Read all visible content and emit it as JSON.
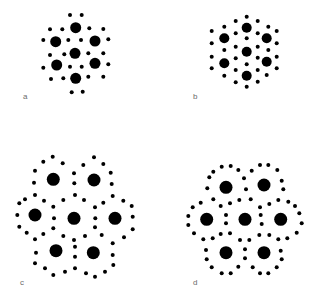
{
  "figure": {
    "dot_color": "#000000",
    "label_color": "#6a6a6a",
    "panels": [
      {
        "id": "a",
        "label": "a",
        "label_pos": [
          23,
          93
        ],
        "large_radius": 5.5,
        "small_radius": 2,
        "large": [
          [
            75.7,
            27.7
          ],
          [
            55.7,
            41.7
          ],
          [
            95,
            41
          ],
          [
            75,
            53.3
          ],
          [
            56.7,
            65
          ],
          [
            95,
            63.3
          ],
          [
            75.7,
            78.3
          ]
        ],
        "small": [
          [
            70,
            15
          ],
          [
            81.7,
            15
          ],
          [
            50,
            29.3
          ],
          [
            62.3,
            29.3
          ],
          [
            89.3,
            28.3
          ],
          [
            103.3,
            29
          ],
          [
            43.3,
            40
          ],
          [
            68.3,
            40
          ],
          [
            81,
            40
          ],
          [
            108.3,
            39.3
          ],
          [
            50,
            55
          ],
          [
            64.3,
            54.3
          ],
          [
            88.3,
            53.3
          ],
          [
            103.3,
            53.3
          ],
          [
            43.3,
            67.7
          ],
          [
            70,
            66.7
          ],
          [
            81.7,
            66.7
          ],
          [
            108.3,
            64.3
          ],
          [
            51,
            79
          ],
          [
            63.3,
            78.3
          ],
          [
            88.3,
            76.7
          ],
          [
            103.3,
            76.7
          ],
          [
            71.7,
            92.3
          ],
          [
            82.7,
            91.7
          ]
        ]
      },
      {
        "id": "b",
        "label": "b",
        "label_pos": [
          193,
          93
        ],
        "large_radius": 5,
        "small_radius": 2,
        "large": [
          [
            246.7,
            27.7
          ],
          [
            224.3,
            38.3
          ],
          [
            266.7,
            38.3
          ],
          [
            246.7,
            51.7
          ],
          [
            224.3,
            63.3
          ],
          [
            266.7,
            61.7
          ],
          [
            246.7,
            75.7
          ]
        ],
        "small": [
          [
            246.7,
            16.7
          ],
          [
            235.7,
            21
          ],
          [
            257.7,
            21
          ],
          [
            224.3,
            26.7
          ],
          [
            268.3,
            26.7
          ],
          [
            235.7,
            33.3
          ],
          [
            257.7,
            33.3
          ],
          [
            211.7,
            31
          ],
          [
            276.7,
            31
          ],
          [
            211.7,
            43.3
          ],
          [
            276.7,
            43.3
          ],
          [
            246.7,
            38.3
          ],
          [
            224.3,
            50
          ],
          [
            268.3,
            50
          ],
          [
            235.7,
            46.7
          ],
          [
            257.7,
            46.7
          ],
          [
            235.7,
            58.3
          ],
          [
            257.7,
            57.7
          ],
          [
            211.7,
            56.7
          ],
          [
            276.7,
            56.7
          ],
          [
            246.7,
            64.3
          ],
          [
            211.7,
            68.3
          ],
          [
            276.7,
            68.3
          ],
          [
            235.7,
            70
          ],
          [
            257.7,
            70
          ],
          [
            224.3,
            75.7
          ],
          [
            266.7,
            75
          ],
          [
            235.7,
            82.3
          ],
          [
            257.7,
            81.7
          ],
          [
            246.7,
            86.7
          ]
        ]
      },
      {
        "id": "c",
        "label": "c",
        "label_pos": [
          20,
          279
        ],
        "large_radius": 6.5,
        "small_radius": 2,
        "large": [
          [
            53.3,
            179.3
          ],
          [
            94,
            180
          ],
          [
            35,
            215
          ],
          [
            74,
            218.3
          ],
          [
            115,
            218.3
          ],
          [
            56,
            250.7
          ],
          [
            93.3,
            252.7
          ]
        ],
        "small": [
          [
            52.7,
            156.7
          ],
          [
            43.3,
            161.7
          ],
          [
            62.7,
            163.3
          ],
          [
            94,
            157.3
          ],
          [
            83.3,
            165
          ],
          [
            103.3,
            164
          ],
          [
            35,
            170.7
          ],
          [
            74,
            173.3
          ],
          [
            110.7,
            172.7
          ],
          [
            34,
            182.7
          ],
          [
            74.3,
            183.3
          ],
          [
            111.7,
            184
          ],
          [
            35,
            195
          ],
          [
            25,
            199.3
          ],
          [
            44,
            200.7
          ],
          [
            63.3,
            200
          ],
          [
            75,
            195
          ],
          [
            84,
            200
          ],
          [
            103.3,
            202.7
          ],
          [
            112.7,
            196
          ],
          [
            123.3,
            200.7
          ],
          [
            19.3,
            203.3
          ],
          [
            131.7,
            206
          ],
          [
            53.3,
            206.7
          ],
          [
            95,
            207.3
          ],
          [
            17.3,
            215
          ],
          [
            54,
            218.3
          ],
          [
            95.3,
            218.3
          ],
          [
            132.7,
            216.7
          ],
          [
            19.3,
            226.7
          ],
          [
            53.3,
            228.3
          ],
          [
            95,
            227.3
          ],
          [
            132.7,
            229.3
          ],
          [
            26.7,
            232.7
          ],
          [
            43.3,
            234
          ],
          [
            63.3,
            236
          ],
          [
            74,
            240
          ],
          [
            85,
            236
          ],
          [
            101.7,
            235
          ],
          [
            124,
            237.3
          ],
          [
            35,
            239.3
          ],
          [
            112.7,
            243.3
          ],
          [
            36,
            252.7
          ],
          [
            75,
            246.7
          ],
          [
            112.7,
            255
          ],
          [
            35,
            263.3
          ],
          [
            75,
            256.7
          ],
          [
            45,
            268.3
          ],
          [
            53.3,
            275
          ],
          [
            65,
            271.7
          ],
          [
            75,
            268.3
          ],
          [
            86,
            273.3
          ],
          [
            95,
            276.7
          ],
          [
            105,
            271.7
          ],
          [
            113.3,
            265
          ]
        ]
      },
      {
        "id": "d",
        "label": "d",
        "label_pos": [
          193,
          279
        ],
        "large_radius": 6.5,
        "small_radius": 2,
        "large": [
          [
            226,
            187.3
          ],
          [
            264,
            185
          ],
          [
            206.7,
            219.3
          ],
          [
            245,
            219.3
          ],
          [
            280.7,
            219.3
          ],
          [
            226,
            252.7
          ],
          [
            264,
            252.7
          ]
        ],
        "small": [
          [
            221.7,
            166.7
          ],
          [
            230.7,
            166
          ],
          [
            213.3,
            171.7
          ],
          [
            238.3,
            170
          ],
          [
            260,
            165
          ],
          [
            268.3,
            165
          ],
          [
            251.7,
            170.7
          ],
          [
            277.3,
            170
          ],
          [
            209.3,
            177.3
          ],
          [
            244,
            178.3
          ],
          [
            281.7,
            180.7
          ],
          [
            207.3,
            188.3
          ],
          [
            246,
            189.3
          ],
          [
            283.3,
            189.3
          ],
          [
            213.3,
            199.3
          ],
          [
            239.3,
            200
          ],
          [
            250.7,
            199.3
          ],
          [
            200.7,
            202.7
          ],
          [
            220.7,
            206
          ],
          [
            230,
            203.3
          ],
          [
            260,
            207.3
          ],
          [
            269.3,
            204
          ],
          [
            278.3,
            200
          ],
          [
            288.3,
            201.7
          ],
          [
            192.7,
            207.3
          ],
          [
            295,
            206
          ],
          [
            188.3,
            216
          ],
          [
            226,
            215
          ],
          [
            260.7,
            215
          ],
          [
            299.3,
            213.3
          ],
          [
            188.3,
            225
          ],
          [
            226,
            223.3
          ],
          [
            261.7,
            224
          ],
          [
            301.7,
            223.3
          ],
          [
            194,
            233.3
          ],
          [
            220.7,
            234
          ],
          [
            230,
            233.3
          ],
          [
            259.3,
            235
          ],
          [
            269.3,
            235
          ],
          [
            296.7,
            232.7
          ],
          [
            203.3,
            239.3
          ],
          [
            212.7,
            238.3
          ],
          [
            240,
            240
          ],
          [
            249.3,
            240
          ],
          [
            278.3,
            239.3
          ],
          [
            287.3,
            238.3
          ],
          [
            206,
            250
          ],
          [
            245,
            249.3
          ],
          [
            280.7,
            250.7
          ],
          [
            206.7,
            259.3
          ],
          [
            245,
            258.3
          ],
          [
            281.7,
            259.3
          ],
          [
            211.7,
            267.3
          ],
          [
            238.3,
            266.7
          ],
          [
            252.7,
            267.3
          ],
          [
            276.7,
            267.3
          ],
          [
            221.7,
            273.3
          ],
          [
            230.7,
            273.3
          ],
          [
            260,
            273.3
          ],
          [
            268.3,
            273.3
          ]
        ]
      }
    ]
  }
}
